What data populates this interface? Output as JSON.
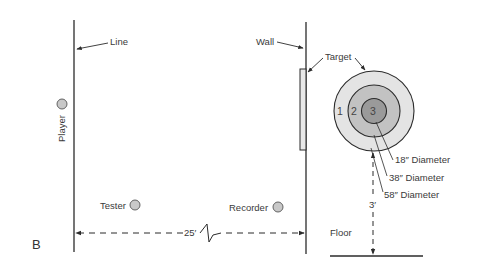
{
  "figure": {
    "panel_label": "B",
    "labels": {
      "line": "Line",
      "wall": "Wall",
      "target": "Target",
      "player": "Player",
      "tester": "Tester",
      "recorder": "Recorder",
      "floor": "Floor"
    },
    "dimensions": {
      "line_to_wall": "25′",
      "target_height": "3′"
    },
    "target_rings": [
      {
        "number": "1",
        "diameter_label": "58″ Diameter",
        "color": "#e4e4e4"
      },
      {
        "number": "2",
        "diameter_label": "38″ Diameter",
        "color": "#c2c2c2"
      },
      {
        "number": "3",
        "diameter_label": "18″ Diameter",
        "color": "#9a9a9a"
      }
    ],
    "colors": {
      "stroke": "#2b2b2b",
      "marker_fill": "#c8c8c8",
      "background": "#ffffff"
    }
  }
}
